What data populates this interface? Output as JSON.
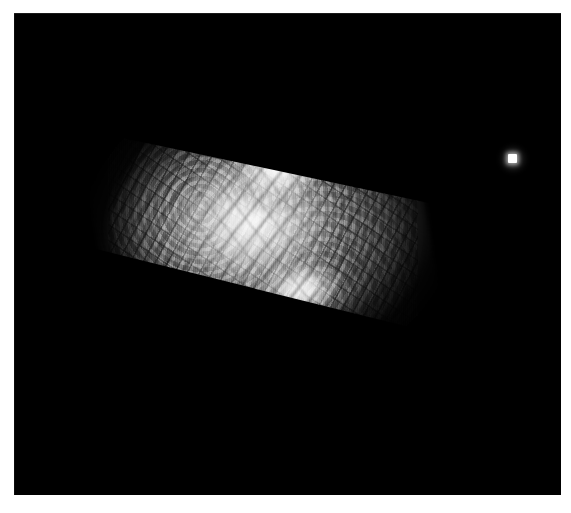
{
  "page": {
    "background_color": "#ffffff",
    "width": 571,
    "height": 513
  },
  "frame": {
    "name": "astronomical-image-frame",
    "background_color": "#000000",
    "left": 14,
    "top": 13,
    "width": 547,
    "height": 482
  },
  "objects": {
    "nebula": {
      "label": "extended-diffuse-source",
      "description": "bright mottled filamentary extended object, elongated along a NE-SW diagonal, with sharp straight edges on the upper-right and lower-right",
      "center_x": 263,
      "center_y": 237,
      "width": 310,
      "height": 290,
      "peak_color": "#ffffff",
      "mid_color": "#b4b4b4",
      "edge_color": "#303030",
      "bright_knots": [
        {
          "name": "upper-core-knot",
          "x": 285,
          "y": 185
        },
        {
          "name": "lower-core-knot",
          "x": 272,
          "y": 300
        }
      ]
    },
    "point_source": {
      "label": "star",
      "x": 513,
      "y": 159,
      "core_size": 9,
      "color": "#ffffff"
    },
    "artifact_streak": {
      "label": "faint-horizontal-streak",
      "x": 84,
      "y": 61,
      "width": 34,
      "color": "#463a30"
    }
  },
  "palette": {
    "sky": "#000000",
    "page": "#ffffff",
    "highlight": "#ffffff",
    "midtone": "#969696",
    "shadow": "#141414"
  }
}
